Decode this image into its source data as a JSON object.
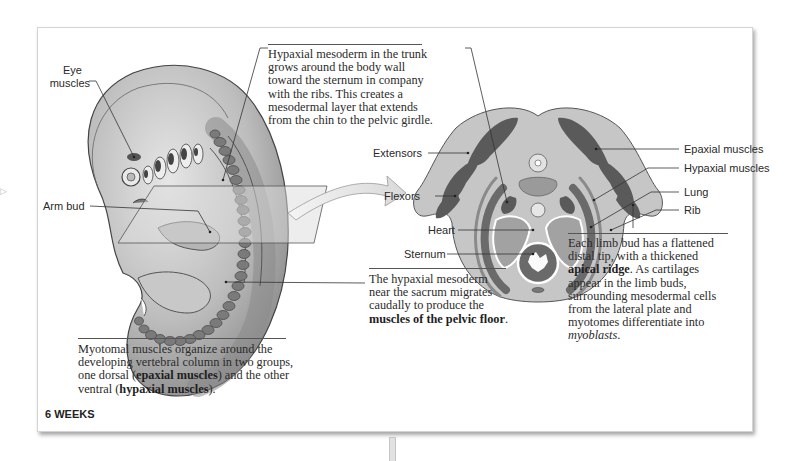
{
  "figure": {
    "stage_label": "6 WEEKS",
    "embryo_labels": {
      "eye_muscles_line1": "Eye",
      "eye_muscles_line2": "muscles",
      "arm_bud": "Arm bud"
    },
    "section_labels": {
      "extensors": "Extensors",
      "flexors": "Flexors",
      "heart": "Heart",
      "sternum": "Sternum",
      "epaxial_muscles": "Epaxial muscles",
      "hypaxial_muscles": "Hypaxial muscles",
      "lung": "Lung",
      "rib": "Rib"
    },
    "captions": {
      "trunk": {
        "lines": [
          "Hypaxial mesoderm in the trunk",
          "grows around the body wall",
          "toward the sternum in company",
          "with the ribs. This creates a",
          "mesodermal layer that extends",
          "from the chin to the pelvic girdle."
        ]
      },
      "pelvic": {
        "line1": "The hypaxial mesoderm",
        "line2": "near the sacrum migrates",
        "line3": "caudally to produce the",
        "bold": "muscles of the pelvic floor",
        "tail": "."
      },
      "myotomal": {
        "line1": "Myotomal muscles organize around the",
        "line2": "developing vertebral column in two groups,",
        "line3_pre": "one dorsal (",
        "line3_bold": "epaxial muscles",
        "line3_post": ") and the other",
        "line4_pre": "ventral (",
        "line4_bold": "hypaxial muscles",
        "line4_post": ")."
      },
      "limb_bud": {
        "line1": "Each limb bud has a flattened",
        "line2": "distal tip, with a thickened",
        "line3_bold": "apical ridge",
        "line3_post": ". As cartilages",
        "line4": "appear in the limb buds,",
        "line5": "surrounding mesodermal cells",
        "line6": "from the lateral plate and",
        "line7": "myotomes differentiate into",
        "line8_italic": "myoblasts",
        "line8_post": "."
      }
    },
    "colors": {
      "panel_border": "#d4d4d4",
      "tissue_light": "#c4c4c4",
      "tissue_mid": "#9a9a9a",
      "muscle_dark": "#555555",
      "somite": "#767676",
      "leader_line": "#333333"
    }
  },
  "page": {
    "left_arrow_glyph": "▷"
  }
}
